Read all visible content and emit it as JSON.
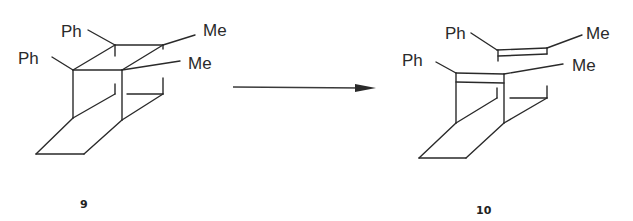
{
  "figure": {
    "type": "reaction-scheme",
    "reactant": {
      "compound_number": "9",
      "substituents": [
        "Ph",
        "Ph",
        "Me",
        "Me"
      ]
    },
    "product": {
      "compound_number": "10",
      "substituents": [
        "Ph",
        "Me",
        "Ph",
        "Me"
      ]
    },
    "arrow": {
      "direction": "right"
    }
  },
  "colors": {
    "ink": "#2a2a2a",
    "background": "#ffffff"
  }
}
